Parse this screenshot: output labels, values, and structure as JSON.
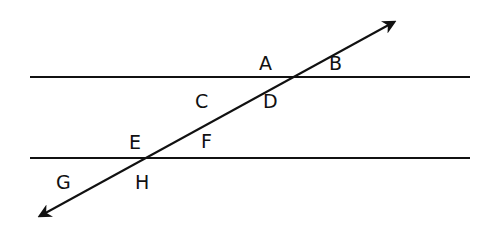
{
  "diagram": {
    "type": "parallel-lines-transversal",
    "stroke_color": "#111111",
    "lines": [
      {
        "name": "top-parallel-line",
        "x1": 30,
        "y1": 77,
        "x2": 470,
        "y2": 77
      },
      {
        "name": "bottom-parallel-line",
        "x1": 30,
        "y1": 158,
        "x2": 470,
        "y2": 158
      }
    ],
    "transversal": {
      "x1": 40,
      "y1": 216,
      "x2": 394,
      "y2": 22
    },
    "angle_labels": [
      {
        "id": "A",
        "text": "A",
        "x": 259,
        "y": 54
      },
      {
        "id": "B",
        "text": "B",
        "x": 329,
        "y": 54
      },
      {
        "id": "C",
        "text": "C",
        "x": 195,
        "y": 92
      },
      {
        "id": "D",
        "text": "D",
        "x": 263,
        "y": 92
      },
      {
        "id": "E",
        "text": "E",
        "x": 129,
        "y": 133
      },
      {
        "id": "F",
        "text": "F",
        "x": 201,
        "y": 132
      },
      {
        "id": "G",
        "text": "G",
        "x": 56,
        "y": 173
      },
      {
        "id": "H",
        "text": "H",
        "x": 135,
        "y": 173
      }
    ]
  }
}
